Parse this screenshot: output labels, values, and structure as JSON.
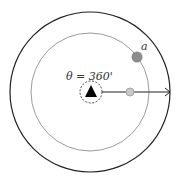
{
  "diagram": {
    "angle_label": "θ = 360'",
    "point_label": "a",
    "colors": {
      "outer_ring": "#222222",
      "inner_ring": "#9a9a9a",
      "point_a": "#8c8c8c",
      "small_point": "#c8c8c8",
      "center_marker": "#000000",
      "arrow": "#222222"
    }
  }
}
